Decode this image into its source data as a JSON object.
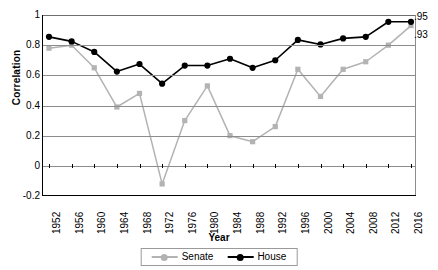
{
  "chart_data": {
    "type": "line",
    "title": "",
    "xlabel": "Year",
    "ylabel": "Correlation",
    "ylim": [
      -0.2,
      1
    ],
    "yticks": [
      1,
      0.8,
      0.6,
      0.4,
      0.2,
      0,
      -0.2
    ],
    "ytick_labels": [
      "1",
      "0.8",
      "0.6",
      "0.4",
      "0.2",
      "0",
      "-0.2"
    ],
    "grid": true,
    "legend_position": "bottom",
    "categories": [
      1952,
      1956,
      1960,
      1964,
      1968,
      1972,
      1976,
      1980,
      1984,
      1988,
      1992,
      1996,
      2000,
      2004,
      2008,
      2012,
      2016
    ],
    "xtick_labels": [
      "1952",
      "1956",
      "1960",
      "1964",
      "1968",
      "1972",
      "1976",
      "1980",
      "1984",
      "1988",
      "1992",
      "1996",
      "2000",
      "2004",
      "2008",
      "2012",
      "2016"
    ],
    "series": [
      {
        "name": "Senate",
        "color": "#b3b3b3",
        "marker": "square",
        "values": [
          0.78,
          0.8,
          0.65,
          0.39,
          0.48,
          -0.12,
          0.3,
          0.53,
          0.2,
          0.16,
          0.26,
          0.64,
          0.46,
          0.64,
          0.69,
          0.8,
          0.93
        ]
      },
      {
        "name": "House",
        "color": "#000000",
        "marker": "circle",
        "values": [
          0.855,
          0.825,
          0.755,
          0.625,
          0.675,
          0.545,
          0.665,
          0.665,
          0.71,
          0.65,
          0.7,
          0.835,
          0.805,
          0.845,
          0.855,
          0.955,
          0.955
        ]
      }
    ],
    "annotations": [
      {
        "text": ".95",
        "series": "House",
        "year": 2016,
        "value": 0.95
      },
      {
        "text": ".93",
        "series": "Senate",
        "year": 2016,
        "value": 0.93
      }
    ]
  },
  "legend": {
    "items": [
      {
        "label": "Senate"
      },
      {
        "label": "House"
      }
    ]
  }
}
